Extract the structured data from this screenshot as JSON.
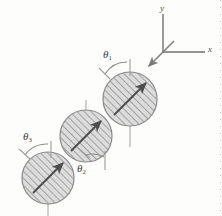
{
  "figure": {
    "background_color": "#fdfdfc",
    "ink_color": "#4a4a4a",
    "hatch_color": "#9a9a9a",
    "disc_fill": "#d9d9d9",
    "arrow_color": "#4d4d4d"
  },
  "axes": {
    "x_label": "x",
    "y_label": "y",
    "origin": {
      "x": 163,
      "y": 52
    },
    "x_end": {
      "x": 205,
      "y": 52
    },
    "y_end": {
      "x": 163,
      "y": 13
    },
    "color": "#6f6f6f"
  },
  "incoming_arrow": {
    "name": "incoming-direction-arrow",
    "from": {
      "x": 173,
      "y": 42
    },
    "to": {
      "x": 147,
      "y": 67
    }
  },
  "discs": [
    {
      "id": "disc-1",
      "label": "θ1",
      "cx": 130,
      "cy": 99,
      "r": 27,
      "arrow_angle_deg": 45,
      "reference_line": {
        "x": 130,
        "y1": 126,
        "y2": 146
      }
    },
    {
      "id": "disc-2",
      "label": "θ2",
      "cx": 86,
      "cy": 136,
      "r": 26,
      "arrow_angle_deg": 45,
      "reference_line": {
        "x": 86,
        "y1": 101,
        "y2": 115
      }
    },
    {
      "id": "disc-3",
      "label": "θ3",
      "cx": 48,
      "cy": 178,
      "r": 26,
      "arrow_angle_deg": 45,
      "reference_line": {
        "x": 48,
        "y1": 204,
        "y2": 216
      }
    }
  ],
  "angles": [
    {
      "name": "theta-1",
      "symbol": "θ",
      "subscript": "1",
      "label_x": 103,
      "label_y": 50,
      "vertex": {
        "x": 112,
        "y": 78
      },
      "tick_line": {
        "x": 130,
        "y1": 60,
        "y2": 76
      }
    },
    {
      "name": "theta-2",
      "symbol": "θ",
      "subscript": "2",
      "label_x": 77,
      "label_y": 168,
      "vertex": {
        "x": 92,
        "y": 157
      },
      "tick_line": {
        "x": 105,
        "y1": 152,
        "y2": 170
      }
    },
    {
      "name": "theta-3",
      "symbol": "θ",
      "subscript": "3",
      "label_x": 23,
      "label_y": 133,
      "vertex": {
        "x": 31,
        "y": 157
      },
      "tick_line": {
        "x": 51,
        "y1": 142,
        "y2": 158
      }
    }
  ]
}
